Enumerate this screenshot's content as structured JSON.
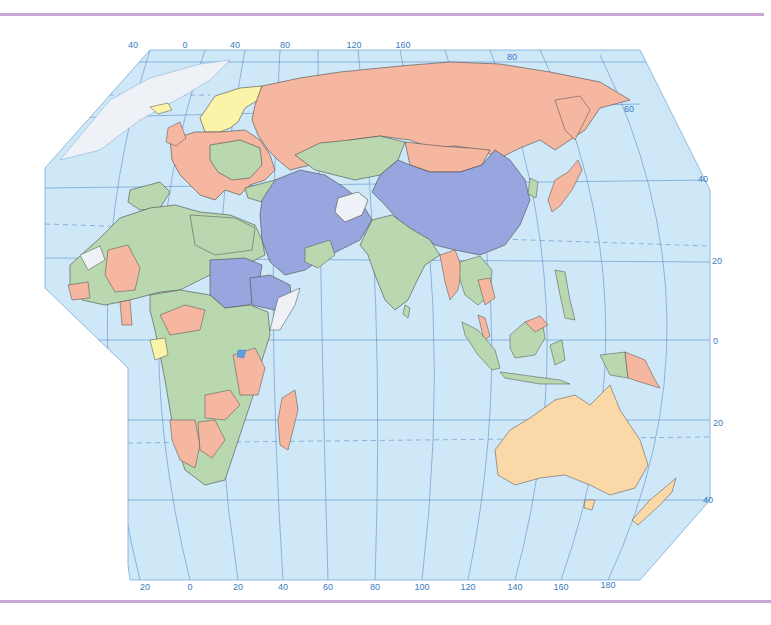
{
  "map": {
    "projection": "Eurasia, Africa and Oceania political map",
    "colors": {
      "ocean": "#cfe8f7",
      "graticule": "#5a8fc8",
      "salmon": "#f5b7a0",
      "green": "#b9d8b0",
      "blue": "#98a6e0",
      "yellow": "#fbf3a8",
      "sand": "#fbd8a8",
      "white": "#eef1f5",
      "border": "#4a4a4a",
      "frame_rule": "#c9a6d6"
    },
    "top_longitude_labels": [
      {
        "text": "40",
        "x": 133,
        "y": 40
      },
      {
        "text": "0",
        "x": 185,
        "y": 40
      },
      {
        "text": "40",
        "x": 235,
        "y": 40
      },
      {
        "text": "80",
        "x": 285,
        "y": 40
      },
      {
        "text": "120",
        "x": 354,
        "y": 40
      },
      {
        "text": "160",
        "x": 403,
        "y": 40
      }
    ],
    "bottom_longitude_labels": [
      {
        "text": "20",
        "x": 145,
        "y": 582
      },
      {
        "text": "0",
        "x": 190,
        "y": 582
      },
      {
        "text": "20",
        "x": 238,
        "y": 582
      },
      {
        "text": "40",
        "x": 283,
        "y": 582
      },
      {
        "text": "60",
        "x": 328,
        "y": 582
      },
      {
        "text": "80",
        "x": 375,
        "y": 582
      },
      {
        "text": "100",
        "x": 422,
        "y": 582
      },
      {
        "text": "120",
        "x": 468,
        "y": 582
      },
      {
        "text": "140",
        "x": 515,
        "y": 582
      },
      {
        "text": "160",
        "x": 561,
        "y": 582
      },
      {
        "text": "180",
        "x": 608,
        "y": 580
      }
    ],
    "right_latitude_labels": [
      {
        "text": "80",
        "x": 512,
        "y": 54
      },
      {
        "text": "60",
        "x": 625,
        "y": 104
      },
      {
        "text": "40",
        "x": 698,
        "y": 176
      },
      {
        "text": "20",
        "x": 712,
        "y": 258
      },
      {
        "text": "0",
        "x": 713,
        "y": 337
      },
      {
        "text": "20",
        "x": 713,
        "y": 420
      },
      {
        "text": "40",
        "x": 703,
        "y": 497
      }
    ],
    "regions": [
      {
        "name": "russia",
        "color": "salmon"
      },
      {
        "name": "china",
        "color": "blue"
      },
      {
        "name": "middle-east",
        "color": "blue"
      },
      {
        "name": "sudan-ethiopia",
        "color": "blue"
      },
      {
        "name": "kazakhstan",
        "color": "green"
      },
      {
        "name": "india",
        "color": "green"
      },
      {
        "name": "scandinavia",
        "color": "yellow"
      },
      {
        "name": "australia",
        "color": "sand"
      },
      {
        "name": "afghanistan",
        "color": "white"
      },
      {
        "name": "north-africa",
        "color": "green"
      },
      {
        "name": "southern-africa",
        "color": "green"
      },
      {
        "name": "europe",
        "color": "salmon"
      },
      {
        "name": "southeast-asia",
        "color": "green"
      },
      {
        "name": "indonesia",
        "color": "green"
      },
      {
        "name": "papua-new-guinea",
        "color": "salmon"
      },
      {
        "name": "japan",
        "color": "salmon"
      },
      {
        "name": "madagascar",
        "color": "salmon"
      },
      {
        "name": "new-zealand",
        "color": "sand"
      }
    ]
  }
}
